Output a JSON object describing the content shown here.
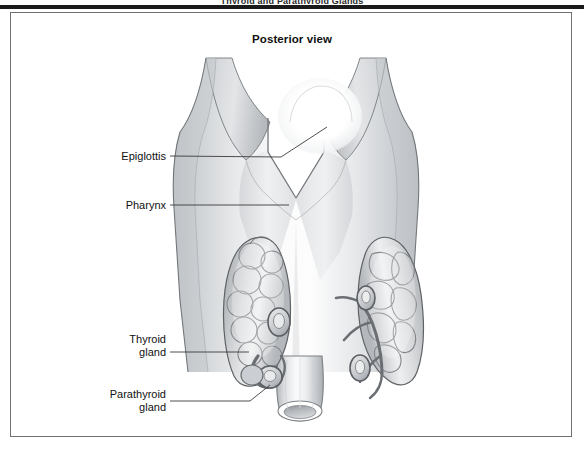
{
  "plate": {
    "running_head": "Thyroid and Parathyroid Glands",
    "figure_title": "Posterior view"
  },
  "labels": {
    "epiglottis": "Epiglottis",
    "pharynx": "Pharynx",
    "thyroid_gland_line1": "Thyroid",
    "thyroid_gland_line2": "gland",
    "parathyroid_gland_line1": "Parathyroid",
    "parathyroid_gland_line2": "gland"
  },
  "colors": {
    "page_background": "#ffffff",
    "top_rule": "#1a1a1a",
    "frame_border": "#6f7072",
    "label_text": "#111111",
    "leader_line": "#3b3b3b",
    "tissue_light": "#f2f3f4",
    "tissue_mid": "#d6d8da",
    "tissue_dark": "#a9acb0",
    "outline": "#6d7073",
    "gland_outline": "#5b5f63",
    "vessel_dark": "#6a6d71",
    "epiglottis_highlight": "#ffffff"
  },
  "anatomy": {
    "view": "Posterior view",
    "structures": [
      "Epiglottis",
      "Pharynx",
      "Thyroid gland",
      "Parathyroid gland"
    ]
  }
}
